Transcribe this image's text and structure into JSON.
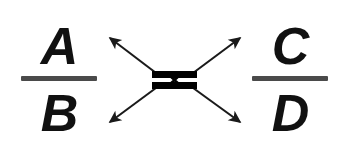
{
  "diagram": {
    "background_color": "#ffffff",
    "ink_color": "#111111",
    "bar_color": "#4a4a4a",
    "arrow_color": "#1a1a1a",
    "left_fraction": {
      "numerator": "A",
      "denominator": "B",
      "bar_label": "fraction-bar"
    },
    "right_fraction": {
      "numerator": "C",
      "denominator": "D",
      "bar_label": "fraction-bar"
    },
    "center": {
      "symbol_name": "crossover-bowtie",
      "top_bar_label": "chromatid-bar-top",
      "bottom_bar_label": "chromatid-bar-bottom",
      "cross_label": "crossing-point"
    },
    "arrows": [
      {
        "name": "arrow-up-left",
        "direction": "up-left",
        "from": "center",
        "to": "A"
      },
      {
        "name": "arrow-up-right",
        "direction": "up-right",
        "from": "center",
        "to": "C"
      },
      {
        "name": "arrow-down-left",
        "direction": "down-left",
        "from": "center",
        "to": "B"
      },
      {
        "name": "arrow-down-right",
        "direction": "down-right",
        "from": "center",
        "to": "D"
      }
    ]
  }
}
